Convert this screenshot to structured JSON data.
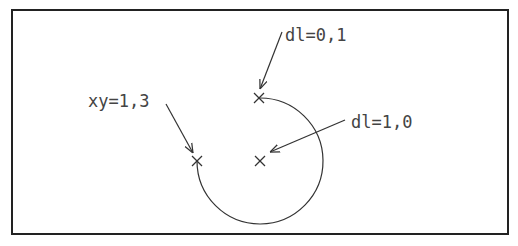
{
  "diagram": {
    "type": "arc-definition",
    "labels": {
      "start_point": "xy=1,3",
      "arc_start_direction": "dl=0,1",
      "arc_center_direction": "dl=1,0"
    },
    "markers": [
      {
        "name": "start-point",
        "x": 197,
        "y": 161
      },
      {
        "name": "arc-end-point",
        "x": 259,
        "y": 98
      },
      {
        "name": "center-point",
        "x": 260,
        "y": 161
      }
    ],
    "arc": {
      "center_x": 260,
      "center_y": 161,
      "radius": 63,
      "sweep_degrees": 270
    },
    "colors": {
      "line": "#333333",
      "frame": "#222222",
      "text": "#444444",
      "background": "#ffffff"
    }
  }
}
